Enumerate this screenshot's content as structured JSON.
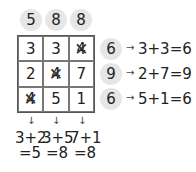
{
  "column_totals": [
    "5",
    "8",
    "8"
  ],
  "grid": [
    [
      {
        "value": "3",
        "crossed": false
      },
      {
        "value": "3",
        "crossed": false
      },
      {
        "value": "4",
        "crossed": true
      }
    ],
    [
      {
        "value": "2",
        "crossed": false
      },
      {
        "value": "4",
        "crossed": true
      },
      {
        "value": "7",
        "crossed": false
      }
    ],
    [
      {
        "value": "4",
        "crossed": true
      },
      {
        "value": "5",
        "crossed": false
      },
      {
        "value": "1",
        "crossed": false
      }
    ]
  ],
  "row_totals": [
    "6",
    "9",
    "6"
  ],
  "row_equations": [
    "3+3=6",
    "2+7=9",
    "5+1=6"
  ],
  "column_equations": [
    {
      "expr": "3+2",
      "result": "=5"
    },
    {
      "expr": "3+5",
      "result": "=8"
    },
    {
      "expr": "7+1",
      "result": "=8"
    }
  ],
  "arrow_right": "→",
  "arrow_down": "↓"
}
